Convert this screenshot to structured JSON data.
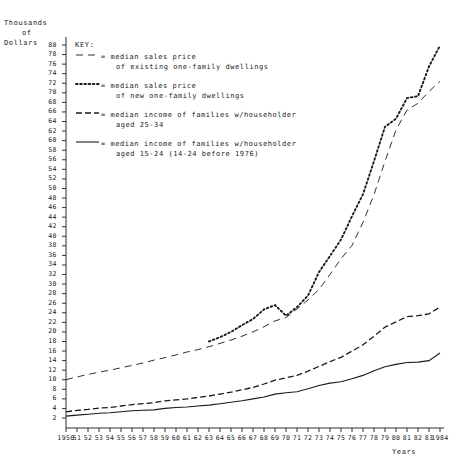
{
  "axes": {
    "y_title_line1": "Thousands",
    "y_title_line2": "of",
    "y_title_line3": "Dollars",
    "x_title": "Years",
    "y_ticks": [
      80,
      78,
      76,
      74,
      72,
      70,
      68,
      66,
      64,
      62,
      60,
      58,
      56,
      54,
      52,
      50,
      48,
      46,
      44,
      42,
      40,
      38,
      36,
      34,
      32,
      30,
      28,
      26,
      24,
      22,
      20,
      18,
      16,
      14,
      12,
      10,
      8,
      6,
      4,
      2
    ],
    "x_ticks": [
      "1950",
      "51",
      "52",
      "53",
      "54",
      "55",
      "56",
      "57",
      "58",
      "59",
      "60",
      "61",
      "62",
      "63",
      "64",
      "65",
      "66",
      "67",
      "68",
      "69",
      "70",
      "71",
      "72",
      "73",
      "74",
      "75",
      "76",
      "77",
      "78",
      "79",
      "80",
      "81",
      "82",
      "83",
      "1984"
    ]
  },
  "legend": {
    "title": "KEY:",
    "entries": [
      {
        "style": "long-dash",
        "line1": "= median sales price",
        "line2": "of existing one-family dwellings"
      },
      {
        "style": "dotted",
        "line1": "= median sales price",
        "line2": "of new one-family dwellings"
      },
      {
        "style": "medium-dash",
        "line1": "= median income of families w/householder",
        "line2": "aged 25-34"
      },
      {
        "style": "solid",
        "line1": "= median income of families w/householder",
        "line2": "aged 15-24 (14-24 before 1976)"
      }
    ]
  },
  "colors": {
    "ink": "#1a1a1a",
    "background": "#ffffff"
  },
  "chart_data": {
    "type": "line",
    "title": "",
    "xlabel": "Years",
    "ylabel": "Thousands of Dollars",
    "xlim": [
      1950,
      1984
    ],
    "ylim": [
      0,
      80
    ],
    "grid": false,
    "legend_position": "top-left-inside",
    "x": [
      1950,
      1951,
      1952,
      1953,
      1954,
      1955,
      1956,
      1957,
      1958,
      1959,
      1960,
      1961,
      1962,
      1963,
      1964,
      1965,
      1966,
      1967,
      1968,
      1969,
      1970,
      1971,
      1972,
      1973,
      1974,
      1975,
      1976,
      1977,
      1978,
      1979,
      1980,
      1981,
      1982,
      1983,
      1984
    ],
    "series": [
      {
        "name": "median sales price of existing one-family dwellings",
        "style": "long-dash",
        "values": [
          10.0,
          10.6,
          11.1,
          11.6,
          12.0,
          12.5,
          13.0,
          13.5,
          14.1,
          14.6,
          15.2,
          15.8,
          16.3,
          16.9,
          17.6,
          18.3,
          19.1,
          20.0,
          21.1,
          22.3,
          23.0,
          24.8,
          26.7,
          28.9,
          32.0,
          35.3,
          38.1,
          42.9,
          48.7,
          55.7,
          62.2,
          66.4,
          67.8,
          70.3,
          72.4
        ]
      },
      {
        "name": "median sales price of new one-family dwellings",
        "style": "dotted",
        "values": [
          null,
          null,
          null,
          null,
          null,
          null,
          null,
          null,
          null,
          null,
          null,
          null,
          null,
          18.0,
          18.9,
          20.0,
          21.4,
          22.7,
          24.7,
          25.6,
          23.4,
          25.2,
          27.6,
          32.5,
          35.9,
          39.3,
          44.2,
          48.8,
          55.7,
          62.9,
          64.6,
          68.9,
          69.3,
          75.5,
          79.9
        ]
      },
      {
        "name": "median income of families w/householder aged 25-34",
        "style": "medium-dash",
        "values": [
          3.3,
          3.6,
          3.8,
          4.1,
          4.2,
          4.5,
          4.8,
          5.0,
          5.2,
          5.6,
          5.8,
          6.0,
          6.3,
          6.6,
          7.0,
          7.4,
          7.9,
          8.4,
          9.1,
          9.9,
          10.4,
          10.9,
          11.8,
          12.8,
          13.8,
          14.7,
          16.0,
          17.3,
          19.1,
          21.0,
          22.1,
          23.2,
          23.4,
          23.8,
          25.2
        ]
      },
      {
        "name": "median income of families w/householder aged 15-24 (14-24 before 1976)",
        "style": "solid",
        "values": [
          2.4,
          2.6,
          2.8,
          3.0,
          3.1,
          3.3,
          3.5,
          3.6,
          3.7,
          4.0,
          4.2,
          4.3,
          4.5,
          4.7,
          5.0,
          5.3,
          5.6,
          6.0,
          6.4,
          7.0,
          7.3,
          7.5,
          8.1,
          8.8,
          9.3,
          9.6,
          10.2,
          10.9,
          11.9,
          12.7,
          13.2,
          13.6,
          13.7,
          14.0,
          15.6
        ]
      }
    ]
  }
}
